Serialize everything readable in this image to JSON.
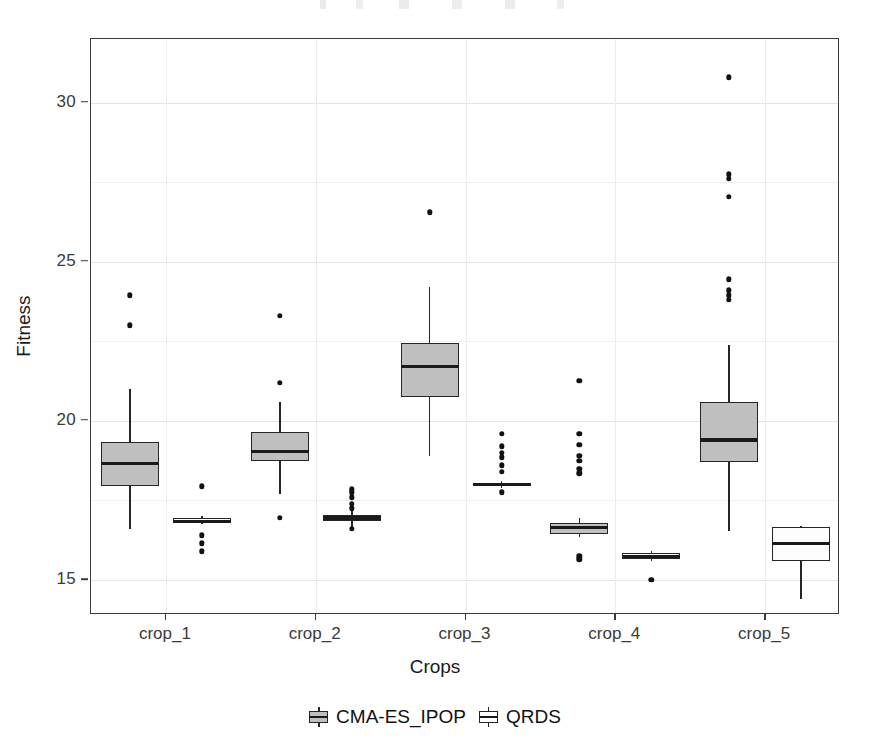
{
  "chart_data": {
    "type": "box",
    "title": "",
    "xlabel": "Crops",
    "ylabel": "Fitness",
    "categories": [
      "crop_1",
      "crop_2",
      "crop_3",
      "crop_4",
      "crop_5"
    ],
    "ytick_labels": [
      "15",
      "20",
      "25",
      "30"
    ],
    "ytick_values": [
      15,
      20,
      25,
      30
    ],
    "ylim": [
      13.9,
      32.0
    ],
    "grid": "horizontal-and-vertical-light",
    "legend": {
      "position": "bottom-center",
      "entries": [
        {
          "name": "CMA-ES_IPOP",
          "fill": "#bfbfbf",
          "style": "filled"
        },
        {
          "name": "QRDS",
          "fill": "#fdfdfd",
          "style": "open"
        }
      ]
    },
    "series": [
      {
        "name": "CMA-ES_IPOP",
        "boxes": [
          {
            "category": "crop_1",
            "min": 16.6,
            "q1": 17.95,
            "median": 18.65,
            "q3": 19.35,
            "max": 21.0,
            "outliers": [
              23.95,
              23.0
            ]
          },
          {
            "category": "crop_2",
            "min": 17.7,
            "q1": 18.75,
            "median": 19.05,
            "q3": 19.65,
            "max": 20.6,
            "outliers": [
              23.3,
              21.2,
              16.95
            ]
          },
          {
            "category": "crop_3",
            "min": 18.9,
            "q1": 20.75,
            "median": 21.7,
            "q3": 22.45,
            "max": 24.2,
            "outliers": [
              26.55
            ]
          },
          {
            "category": "crop_4",
            "min": 16.35,
            "q1": 16.45,
            "median": 16.65,
            "q3": 16.8,
            "max": 16.95,
            "outliers": [
              21.25,
              19.6,
              19.25,
              18.9,
              18.75,
              18.5,
              18.35,
              15.75,
              15.65
            ]
          },
          {
            "category": "crop_5",
            "min": 16.55,
            "q1": 18.7,
            "median": 19.4,
            "q3": 20.6,
            "max": 22.4,
            "outliers": [
              30.8,
              27.75,
              27.6,
              27.05,
              24.45,
              24.1,
              23.95,
              23.8
            ]
          }
        ]
      },
      {
        "name": "QRDS",
        "boxes": [
          {
            "category": "crop_1",
            "min": 16.75,
            "q1": 16.8,
            "median": 16.85,
            "q3": 16.95,
            "max": 17.0,
            "outliers": [
              17.95,
              16.4,
              16.15,
              15.9
            ]
          },
          {
            "category": "crop_2",
            "min": 16.6,
            "q1": 16.85,
            "median": 16.95,
            "q3": 17.05,
            "max": 17.2,
            "outliers": [
              17.85,
              17.75,
              17.6,
              17.4,
              17.25,
              16.6
            ]
          },
          {
            "category": "crop_3",
            "min": 17.9,
            "q1": 17.95,
            "median": 18.0,
            "q3": 18.05,
            "max": 18.1,
            "outliers": [
              19.6,
              19.2,
              19.0,
              18.85,
              18.6,
              18.4,
              17.75
            ]
          },
          {
            "category": "crop_4",
            "min": 15.6,
            "q1": 15.65,
            "median": 15.75,
            "q3": 15.85,
            "max": 15.9,
            "outliers": [
              15.0
            ]
          },
          {
            "category": "crop_5",
            "min": 14.4,
            "q1": 15.6,
            "median": 16.15,
            "q3": 16.65,
            "max": 16.7,
            "outliers": []
          }
        ]
      }
    ]
  }
}
